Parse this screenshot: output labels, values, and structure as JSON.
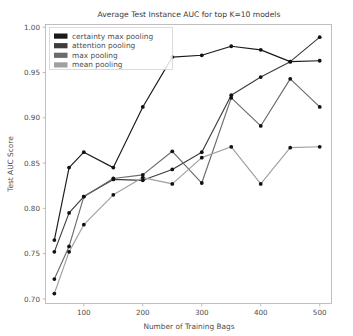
{
  "chart_data": {
    "type": "line",
    "title": "Average Test Instance AUC for top K=10 models",
    "xlabel": "Number of Training Bags",
    "ylabel": "Test AUC Score",
    "xlim": [
      35,
      520
    ],
    "ylim": [
      0.695,
      1.003
    ],
    "xticks": [
      100,
      200,
      300,
      400,
      500
    ],
    "xtick_labels": [
      "100",
      "200",
      "300",
      "400",
      "500"
    ],
    "yticks": [
      0.7,
      0.75,
      0.8,
      0.85,
      0.9,
      0.95,
      1.0
    ],
    "ytick_labels": [
      "0.70",
      "0.75",
      "0.80",
      "0.85",
      "0.90",
      "0.95",
      "1.00"
    ],
    "grid": false,
    "legend_position": "upper left",
    "x": [
      50,
      75,
      100,
      150,
      200,
      250,
      300,
      350,
      400,
      450,
      500
    ],
    "series": [
      {
        "name": "certainty max pooling",
        "color": "#1a1a1a",
        "values": [
          0.765,
          0.845,
          0.862,
          0.845,
          0.912,
          0.967,
          0.969,
          0.979,
          0.975,
          0.962,
          0.963
        ]
      },
      {
        "name": "attention pooling",
        "color": "#3d3d3d",
        "values": [
          0.752,
          0.795,
          0.813,
          0.832,
          0.831,
          0.843,
          0.862,
          0.925,
          0.945,
          0.962,
          0.989
        ]
      },
      {
        "name": "max pooling",
        "color": "#6b6b6b",
        "values": [
          0.722,
          0.758,
          0.813,
          0.833,
          0.837,
          0.863,
          0.828,
          0.922,
          0.891,
          0.943,
          0.912
        ]
      },
      {
        "name": "mean pooling",
        "color": "#a0a0a0",
        "values": [
          0.706,
          0.752,
          0.782,
          0.815,
          0.834,
          0.827,
          0.856,
          0.868,
          0.827,
          0.867,
          0.868
        ]
      }
    ]
  },
  "legend": {
    "entries": [
      {
        "label": "certainty max pooling",
        "color": "#1a1a1a"
      },
      {
        "label": "attention pooling",
        "color": "#3d3d3d"
      },
      {
        "label": "max pooling",
        "color": "#6b6b6b"
      },
      {
        "label": "mean pooling",
        "color": "#a0a0a0"
      }
    ]
  }
}
